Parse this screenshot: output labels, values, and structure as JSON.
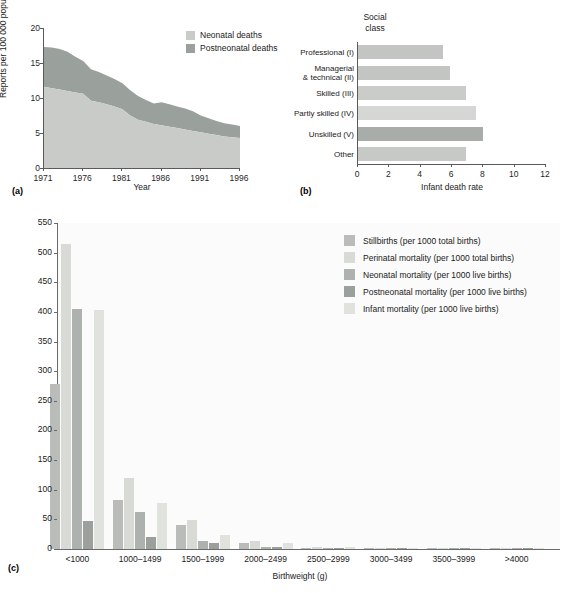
{
  "figure": {
    "panels": [
      {
        "letter": "(a)"
      },
      {
        "letter": "(b)"
      },
      {
        "letter": "(c)"
      }
    ]
  },
  "colors": {
    "neonatal_light": "#c9cbc9",
    "postneonatal_mid": "#9aa09c",
    "bar_light": "#d9dbd7",
    "bar_mid": "#c5c8c4",
    "bar_dark": "#a8aca8",
    "bar_darkest": "#9298928",
    "axis": "#5a5a5a",
    "plot_bg": "#fbfbfb"
  },
  "chart_data": [
    {
      "id": "panel-a",
      "type": "area",
      "title": "",
      "xlabel": "Year",
      "ylabel": "Reports per 100 000 population",
      "xlim": [
        1971,
        1996
      ],
      "ylim": [
        0,
        20
      ],
      "yticks": [
        0,
        5,
        10,
        15,
        20
      ],
      "xticks": [
        1971,
        1976,
        1981,
        1986,
        1991,
        1996
      ],
      "grid": false,
      "legend_position": "top-right",
      "stacked": true,
      "series": [
        {
          "name": "Neonatal deaths",
          "color": "#c9cbc9",
          "values": [
            11.6,
            11.4,
            11.2,
            11.0,
            10.8,
            10.6,
            9.6,
            9.4,
            9.1,
            8.8,
            8.4,
            7.5,
            6.9,
            6.6,
            6.3,
            6.1,
            5.9,
            5.7,
            5.5,
            5.3,
            5.1,
            4.9,
            4.7,
            4.5,
            4.4,
            4.3
          ]
        },
        {
          "name": "Postneonatal deaths",
          "color": "#9aa09c",
          "values": [
            5.7,
            5.8,
            5.8,
            5.6,
            5.1,
            4.7,
            4.5,
            4.3,
            4.1,
            3.9,
            3.7,
            3.6,
            3.4,
            3.1,
            2.9,
            3.3,
            3.2,
            3.1,
            3.0,
            2.8,
            2.4,
            2.2,
            2.0,
            1.9,
            1.8,
            1.7
          ]
        }
      ],
      "x": [
        1971,
        1972,
        1973,
        1974,
        1975,
        1976,
        1977,
        1978,
        1979,
        1980,
        1981,
        1982,
        1983,
        1984,
        1985,
        1986,
        1987,
        1988,
        1989,
        1990,
        1991,
        1992,
        1993,
        1994,
        1995,
        1996
      ]
    },
    {
      "id": "panel-b",
      "type": "bar",
      "orientation": "horizontal",
      "header": "Social\nclass",
      "header_line1": "Social",
      "header_line2": "class",
      "xlabel": "Infant death rate",
      "ylabel": "",
      "xlim": [
        0,
        12
      ],
      "xticks": [
        0,
        2,
        4,
        6,
        8,
        10,
        12
      ],
      "grid": false,
      "categories": [
        "Professional (I)",
        "Managerial\n& technical (II)",
        "Skilled (III)",
        "Partly skilled (IV)",
        "Unskilled (V)",
        "Other"
      ],
      "category_labels": [
        {
          "line1": "Professional (I)",
          "line2": ""
        },
        {
          "line1": "Managerial",
          "line2": "& technical (II)"
        },
        {
          "line1": "Skilled (III)",
          "line2": ""
        },
        {
          "line1": "Partly skilled (IV)",
          "line2": ""
        },
        {
          "line1": "Unskilled (V)",
          "line2": ""
        },
        {
          "line1": "Other",
          "line2": ""
        }
      ],
      "values": [
        5.4,
        5.9,
        6.9,
        7.5,
        8.0,
        6.9
      ],
      "bar_colors": [
        "#c2c5c1",
        "#c2c5c1",
        "#c9ccc8",
        "#d4d7d3",
        "#a9ada9",
        "#c6c9c5"
      ]
    },
    {
      "id": "panel-c",
      "type": "bar",
      "orientation": "vertical",
      "grouped": true,
      "title": "",
      "xlabel": "Birthweight (g)",
      "ylabel": "",
      "ylim": [
        0,
        550
      ],
      "yticks": [
        0,
        50,
        100,
        150,
        200,
        250,
        300,
        350,
        400,
        450,
        500,
        550
      ],
      "grid": false,
      "legend_position": "top-right",
      "categories": [
        "<1000",
        "1000–1499",
        "1500–1999",
        "2000–2499",
        "2500–2999",
        "3000–3499",
        "3500–3999",
        ">4000"
      ],
      "series": [
        {
          "name": "Stillbirths (per 1000 total births)",
          "color": "#b9bcb8",
          "values": [
            279,
            82,
            40,
            10,
            2,
            1,
            1,
            1
          ]
        },
        {
          "name": "Perinatal mortality (per 1000 total births)",
          "color": "#d8dad6",
          "values": [
            514,
            120,
            49,
            13,
            3,
            2,
            1,
            1
          ]
        },
        {
          "name": "Neonatal mortality (per 1000 live births)",
          "color": "#aeb2ae",
          "values": [
            405,
            62,
            14,
            4,
            1,
            1,
            1,
            1
          ]
        },
        {
          "name": "Postneonatal mortality (per 1000 live births)",
          "color": "#9ca09c",
          "values": [
            48,
            21,
            10,
            4,
            2,
            1,
            1,
            1
          ]
        },
        {
          "name": "Infant mortality (per 1000 live births)",
          "color": "#e0e2de",
          "values": [
            403,
            78,
            24,
            10,
            3,
            2,
            1,
            1
          ]
        }
      ]
    }
  ]
}
